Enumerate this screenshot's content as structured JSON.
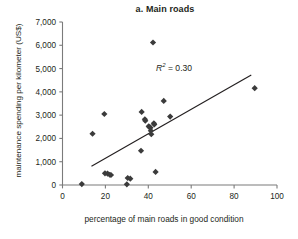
{
  "chart_data": {
    "type": "scatter",
    "title": "a. Main roads",
    "xlabel": "percentage of main roads in good condition",
    "ylabel": "maintenance spending per kilometer (US$)",
    "xlim": [
      0,
      100
    ],
    "ylim": [
      0,
      7000
    ],
    "xticks": [
      0,
      20,
      40,
      60,
      80,
      100
    ],
    "yticks": [
      0,
      1000,
      2000,
      3000,
      4000,
      5000,
      6000,
      7000
    ],
    "xtick_labels": [
      "0",
      "20",
      "40",
      "60",
      "80",
      "100"
    ],
    "ytick_labels": [
      "0",
      "1,000",
      "2,000",
      "3,000",
      "4,000",
      "5,000",
      "6,000",
      "7,000"
    ],
    "grid": false,
    "legend": "none",
    "marker": "diamond",
    "marker_color": "#3b3b3b",
    "annotations": [
      {
        "text": "R2 = 0.30",
        "r_symbol": "R",
        "exponent": "2",
        "equals_value": "= 0.30",
        "x": 56,
        "y": 4450
      }
    ],
    "trendline": {
      "type": "linear",
      "x": [
        13.5,
        88.0
      ],
      "y": [
        800,
        4720
      ],
      "color": "#231f20"
    },
    "points": [
      {
        "x": 9,
        "y": 40
      },
      {
        "x": 14,
        "y": 2200
      },
      {
        "x": 19.5,
        "y": 3050
      },
      {
        "x": 19.8,
        "y": 500
      },
      {
        "x": 21,
        "y": 490
      },
      {
        "x": 22,
        "y": 440
      },
      {
        "x": 22.6,
        "y": 430
      },
      {
        "x": 30,
        "y": 30
      },
      {
        "x": 30.4,
        "y": 300
      },
      {
        "x": 31.6,
        "y": 270
      },
      {
        "x": 36.6,
        "y": 1470
      },
      {
        "x": 36.9,
        "y": 3140
      },
      {
        "x": 38.4,
        "y": 2820
      },
      {
        "x": 38.6,
        "y": 2760
      },
      {
        "x": 40.2,
        "y": 2520
      },
      {
        "x": 40.6,
        "y": 2480
      },
      {
        "x": 41.0,
        "y": 2460
      },
      {
        "x": 41.2,
        "y": 2330
      },
      {
        "x": 41.4,
        "y": 2180
      },
      {
        "x": 42.2,
        "y": 6120
      },
      {
        "x": 42.6,
        "y": 2650
      },
      {
        "x": 42.8,
        "y": 2600
      },
      {
        "x": 43.4,
        "y": 560
      },
      {
        "x": 47.2,
        "y": 3610
      },
      {
        "x": 50.2,
        "y": 2940
      },
      {
        "x": 89.6,
        "y": 4160
      }
    ]
  }
}
